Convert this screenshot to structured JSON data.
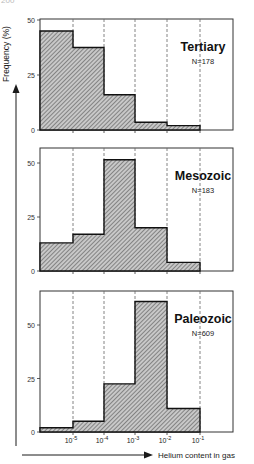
{
  "page": {
    "number": "200"
  },
  "chart_data": {
    "type": "bar",
    "xlabel": "Helium content in gas",
    "ylabel": "Frequency (%)",
    "x_bins": [
      "<10^-5",
      "10^-5–10^-4",
      "10^-4–10^-3",
      "10^-3–10^-2",
      "10^-2–10^-1",
      ">10^-1"
    ],
    "x_tick_labels": [
      "10-5",
      "10-4",
      "10-3",
      "10-2",
      "10-1"
    ],
    "x_tick_base": "10",
    "x_tick_exps": [
      "-5",
      "-4",
      "-3",
      "-2",
      "-1"
    ],
    "y_ticks": [
      0,
      25,
      50
    ],
    "ylim": [
      0,
      50
    ],
    "grid": "dashed vertical at bin boundaries",
    "panels": [
      {
        "name": "Tertiary",
        "n_label": "N=178",
        "values": [
          45,
          37.5,
          16,
          3.5,
          2,
          0
        ]
      },
      {
        "name": "Mesozoic",
        "n_label": "N=183",
        "values": [
          13,
          17,
          51.5,
          20,
          4,
          0
        ]
      },
      {
        "name": "Paleozoic",
        "n_label": "N=609",
        "values": [
          2,
          5,
          22.5,
          61,
          11,
          0
        ]
      }
    ]
  },
  "colors": {
    "axis": "#1a1a1a",
    "fill": "#9a9a9a",
    "hatch": "#555555",
    "grid": "#666666"
  }
}
